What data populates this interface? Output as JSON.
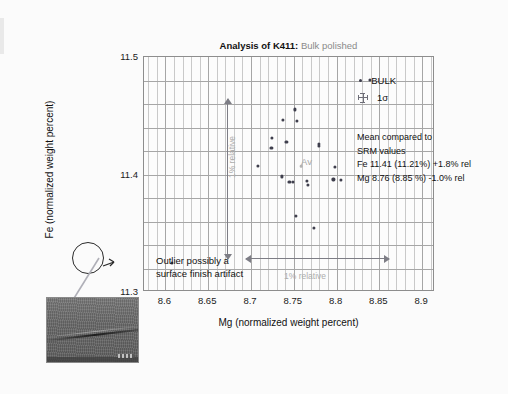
{
  "chart_data": {
    "type": "scatter",
    "title_main": "Analysis of K411:",
    "title_sub": "Bulk polished",
    "xlabel": "Mg (normalized weight percent)",
    "ylabel": "Fe (normalized weight percent)",
    "xlim": [
      8.575,
      8.915
    ],
    "ylim": [
      11.3,
      11.5
    ],
    "xticks": [
      "8.6",
      "8.65",
      "8.7",
      "8.75",
      "8.8",
      "8.85",
      "8.9"
    ],
    "xtick_values": [
      8.6,
      8.65,
      8.7,
      8.75,
      8.8,
      8.85,
      8.9
    ],
    "yticks": [
      "11.3",
      "11.4",
      "11.5"
    ],
    "ytick_values": [
      11.3,
      11.4,
      11.5
    ],
    "grid": "vertical gridlines every 0.01 Mg, horizontal gridlines every 0.02 Fe",
    "legend_position": "upper-right inside axes",
    "series": [
      {
        "name": "BULK",
        "color": "#3f3f4d",
        "points": [
          {
            "x": 8.7525,
            "y": 11.4545
          },
          {
            "x": 8.7385,
            "y": 11.4455
          },
          {
            "x": 8.7545,
            "y": 11.445
          },
          {
            "x": 8.7255,
            "y": 11.4305
          },
          {
            "x": 8.725,
            "y": 11.4215
          },
          {
            "x": 8.7425,
            "y": 11.427
          },
          {
            "x": 8.7095,
            "y": 11.4065
          },
          {
            "x": 8.7805,
            "y": 11.4255
          },
          {
            "x": 8.781,
            "y": 11.4235
          },
          {
            "x": 8.7995,
            "y": 11.4055
          },
          {
            "x": 8.737,
            "y": 11.3975
          },
          {
            "x": 8.746,
            "y": 11.393
          },
          {
            "x": 8.7505,
            "y": 11.393
          },
          {
            "x": 8.7665,
            "y": 11.3935
          },
          {
            "x": 8.7675,
            "y": 11.3905
          },
          {
            "x": 8.7975,
            "y": 11.395
          },
          {
            "x": 8.8065,
            "y": 11.3945
          },
          {
            "x": 8.754,
            "y": 11.364
          },
          {
            "x": 8.7745,
            "y": 11.354
          },
          {
            "x": 8.609,
            "y": 11.324
          },
          {
            "x": 8.84,
            "y": 11.48
          }
        ]
      },
      {
        "name": "Av",
        "color": "#b3b3b3",
        "points": [
          {
            "x": 8.76,
            "y": 11.406
          }
        ]
      }
    ],
    "annotations": {
      "av_label": "Av",
      "vertical_arrow_label": "1% relative",
      "horizontal_arrow_label": "1% relative",
      "outlier_line1": "Outlier possibly a",
      "outlier_line2": "surface finish artifact",
      "mean_note": [
        "Mean compared to",
        "SRM values",
        "Fe  11.41 (11.21%) +1.8% rel",
        "Mg 8.76 (8.85 %) -1.0% rel"
      ]
    }
  },
  "legend": {
    "items": [
      {
        "label": "BULK",
        "marker": "dot-marker-icon"
      },
      {
        "label": "1σ",
        "marker": "error-cross-icon"
      }
    ]
  },
  "inset": {
    "name": "sem-micrograph",
    "description": "grayscale SEM micrograph showing a surface scratch"
  },
  "colors": {
    "marker": "#3f3f4d",
    "av_marker": "#b3b3b3",
    "grid_minor": "#c9c9c9",
    "grid_major": "#a6a6a6",
    "annotation_gray": "#adadad",
    "text": "#111111",
    "title_sub": "#8a8a8a"
  }
}
